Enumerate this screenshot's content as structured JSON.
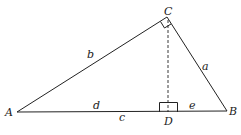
{
  "diagram": {
    "title": "",
    "type": "right-triangle-with-altitude",
    "vertices": {
      "A": {
        "label": "A",
        "x": 17,
        "y": 112
      },
      "B": {
        "label": "B",
        "x": 227,
        "y": 111
      },
      "C": {
        "label": "C",
        "x": 167,
        "y": 17
      },
      "D": {
        "label": "D",
        "x": 168,
        "y": 112
      }
    },
    "sides": {
      "a": {
        "label": "a",
        "from": "C",
        "to": "B"
      },
      "b": {
        "label": "b",
        "from": "A",
        "to": "C"
      },
      "c": {
        "label": "c",
        "from": "A",
        "to": "B"
      },
      "d": {
        "label": "d",
        "from": "A",
        "to": "D"
      },
      "e": {
        "label": "e",
        "from": "D",
        "to": "B"
      }
    },
    "right_angles": [
      "C",
      "D"
    ],
    "altitude": {
      "from": "C",
      "to": "D",
      "style": "dashed"
    }
  }
}
